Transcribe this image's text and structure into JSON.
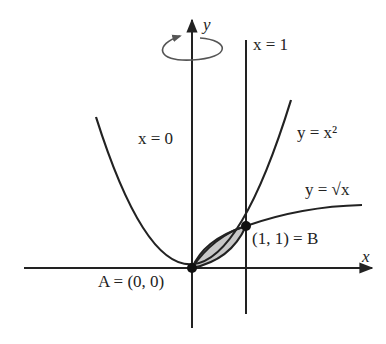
{
  "diagram": {
    "colors": {
      "stroke": "#222222",
      "shade": "#c8c8c8",
      "background": "#ffffff"
    },
    "axes": {
      "x_label": "x",
      "y_label": "y"
    },
    "rotation_indicator": {
      "icon": "rotation-arrow-icon",
      "axis": "y"
    },
    "labels": {
      "x_eq_0": "x = 0",
      "x_eq_1": "x = 1",
      "parabola": "y = x²",
      "sqrt_curve": "y = √x",
      "point_a": "A = (0, 0)",
      "point_b": "(1, 1) = B"
    },
    "points": [
      {
        "name": "A",
        "x": 0,
        "y": 0
      },
      {
        "name": "B",
        "x": 1,
        "y": 1
      }
    ],
    "curves": [
      {
        "name": "parabola",
        "equation": "y = x^2"
      },
      {
        "name": "sqrt",
        "equation": "y = sqrt(x)"
      }
    ],
    "lines": [
      {
        "name": "x=0",
        "equation": "x = 0"
      },
      {
        "name": "x=1",
        "equation": "x = 1"
      }
    ],
    "shaded_region": "between y = sqrt(x) (upper) and y = x^2 (lower), 0 ≤ x ≤ 1"
  }
}
